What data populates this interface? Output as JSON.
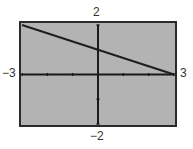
{
  "chart_data": {
    "type": "line",
    "title": "",
    "xlabel": "",
    "ylabel": "",
    "xlim": [
      -3,
      3
    ],
    "ylim": [
      -2,
      2
    ],
    "grid": false,
    "x_tick_step": 1,
    "y_tick_step": 1,
    "series": [
      {
        "name": "y = -x/3 + 1",
        "x": [
          -3,
          3
        ],
        "y": [
          2,
          0
        ]
      }
    ],
    "window_labels": {
      "xmin": "−3",
      "xmax": "3",
      "ymin": "−2",
      "ymax": "2"
    }
  },
  "colors": {
    "screen": "#b3b3b3",
    "border": "#2a2a2a",
    "axis": "#1a1a1a",
    "line": "#1e1e1e"
  }
}
